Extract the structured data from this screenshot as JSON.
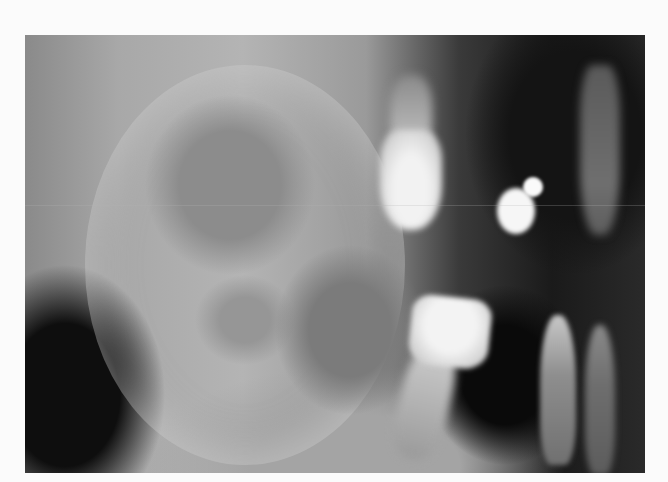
{
  "image": {
    "kind": "dental-radiograph",
    "description": "Grayscale X-ray of jaw showing large radiolucent lesion, upper molar, lower tilted molar, metallic restorations and incisors",
    "palette": {
      "background": "#fbfbfb",
      "bone": "#b4b4b4",
      "soft_tissue_dark": "#141414",
      "tooth_enamel": "#f2f2f2",
      "restoration": "#f8f8f8"
    }
  }
}
